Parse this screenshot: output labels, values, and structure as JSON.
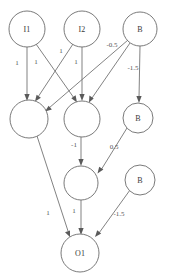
{
  "diagram": {
    "type": "neural-network-graph",
    "canvas": {
      "width": 173,
      "height": 278,
      "background": "#ffffff"
    },
    "style": {
      "node_stroke": "#6b6b6b",
      "edge_stroke": "#6b6b6b",
      "label_color": "#3a3a3a",
      "weight_color": "#555555"
    },
    "nodes": [
      {
        "id": "I1",
        "label": "I1",
        "cx": 27,
        "cy": 29,
        "r": 18,
        "layer": "input"
      },
      {
        "id": "I2",
        "label": "I2",
        "cx": 82,
        "cy": 29,
        "r": 18,
        "layer": "input"
      },
      {
        "id": "B1",
        "label": "B",
        "cx": 140,
        "cy": 29,
        "r": 17,
        "layer": "bias"
      },
      {
        "id": "H1",
        "label": "",
        "cx": 29,
        "cy": 119,
        "r": 19,
        "layer": "hidden"
      },
      {
        "id": "H2",
        "label": "",
        "cx": 82,
        "cy": 119,
        "r": 18,
        "layer": "hidden"
      },
      {
        "id": "B2",
        "label": "B",
        "cx": 138,
        "cy": 118,
        "r": 15,
        "layer": "bias"
      },
      {
        "id": "H3",
        "label": "",
        "cx": 81,
        "cy": 183,
        "r": 17,
        "layer": "hidden"
      },
      {
        "id": "B3",
        "label": "B",
        "cx": 140,
        "cy": 180,
        "r": 15,
        "layer": "bias"
      },
      {
        "id": "O1",
        "label": "O1",
        "cx": 80,
        "cy": 253,
        "r": 19,
        "layer": "output"
      }
    ],
    "edges": [
      {
        "from": "I1",
        "to": "H1",
        "weight": "1",
        "wx": 17,
        "wy": 63
      },
      {
        "from": "I1",
        "to": "H2",
        "weight": "1",
        "wx": 36,
        "wy": 62
      },
      {
        "from": "I2",
        "to": "H1",
        "weight": "1",
        "wx": 61,
        "wy": 51
      },
      {
        "from": "I2",
        "to": "H2",
        "weight": "1",
        "wx": 76,
        "wy": 62
      },
      {
        "from": "B1",
        "to": "H1",
        "weight": "-0.5",
        "wx": 112,
        "wy": 45
      },
      {
        "from": "B1",
        "to": "H2",
        "weight": "",
        "wx": 0,
        "wy": 0
      },
      {
        "from": "B1",
        "to": "B2",
        "weight": "-1.5",
        "wx": 133,
        "wy": 68
      },
      {
        "from": "H2",
        "to": "H3",
        "weight": "-1",
        "wx": 74,
        "wy": 145
      },
      {
        "from": "B2",
        "to": "H3",
        "weight": "0.5",
        "wx": 114,
        "wy": 147
      },
      {
        "from": "H1",
        "to": "O1",
        "weight": "1",
        "wx": 48,
        "wy": 213
      },
      {
        "from": "H3",
        "to": "O1",
        "weight": "1",
        "wx": 74,
        "wy": 211
      },
      {
        "from": "B3",
        "to": "O1",
        "weight": "-1.5",
        "wx": 119,
        "wy": 214
      }
    ]
  }
}
